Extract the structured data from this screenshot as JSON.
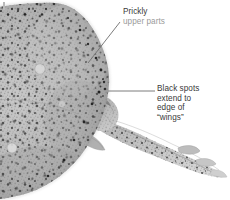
{
  "figure": {
    "background_color": "#ffffff",
    "corner_mark": "figure-crop-tick"
  },
  "callouts": [
    {
      "id": "prickly",
      "name": "callout-prickly-upper-parts",
      "lines": [
        "Prickly",
        "upper parts"
      ],
      "line1": "Prickly",
      "line2": "upper parts",
      "text_color": "#3a3a3a",
      "faded": true,
      "leader": {
        "x1": 120,
        "y1": 22,
        "x2": 88,
        "y2": 63
      }
    },
    {
      "id": "blackspots",
      "name": "callout-black-spots",
      "lines": [
        "Black spots",
        "extend to",
        "edge of",
        "“wings”"
      ],
      "line1": "Black spots",
      "line2": "extend to",
      "line3": "edge of",
      "line4": "“wings”",
      "text_color": "#3a3a3a",
      "faded": false,
      "leader": {
        "x1": 155,
        "y1": 91,
        "x2": 108,
        "y2": 91
      }
    }
  ],
  "leader_line_color": "#6d6d6d",
  "specimen": {
    "body_tone_light": "#d2d2d2",
    "body_tone_mid": "#a8a8a8",
    "body_tone_dark": "#7d7d7d",
    "speckle_color": "#2d2d2d",
    "description": "skate disc with prickly speckled upper surface and tapering spotted tail"
  }
}
